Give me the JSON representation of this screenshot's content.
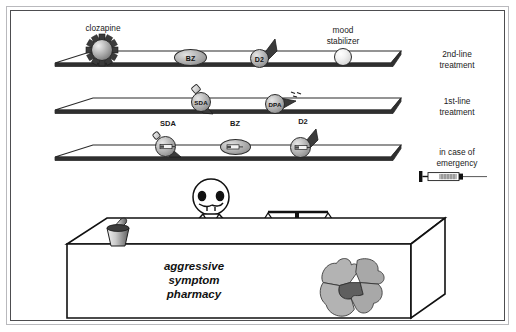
{
  "figure": {
    "title_text_block": [
      "aggressive",
      "symptom",
      "pharmacy"
    ],
    "shelves": [
      {
        "id": "second-line",
        "side_label": [
          "2nd-line",
          "treatment"
        ],
        "items": [
          {
            "key": "clozapine",
            "label": "clozapine",
            "inner_text": "",
            "icon": "spiky-sphere",
            "label_position": "above"
          },
          {
            "key": "bz",
            "label": "",
            "inner_text": "BZ",
            "icon": "oval",
            "label_position": "inside"
          },
          {
            "key": "d2",
            "label": "",
            "inner_text": "D2",
            "icon": "sphere-with-arrow",
            "label_position": "inside"
          },
          {
            "key": "mood-stabilizer",
            "label": "mood stabilizer",
            "inner_text": "",
            "icon": "light-sphere",
            "label_position": "above"
          }
        ]
      },
      {
        "id": "first-line",
        "side_label": [
          "1st-line",
          "treatment"
        ],
        "items": [
          {
            "key": "sda",
            "label": "",
            "inner_text": "SDA",
            "icon": "sphere-stub-cone",
            "label_position": "inside"
          },
          {
            "key": "dpa",
            "label": "",
            "inner_text": "DPA",
            "icon": "sphere-arrow-dashes",
            "label_position": "inside"
          }
        ]
      },
      {
        "id": "emergency",
        "side_label": [
          "in case of",
          "emergency"
        ],
        "items": [
          {
            "key": "sda-inj",
            "label": "SDA",
            "inner_text": "",
            "icon": "sphere-stub-cone-syringe",
            "label_position": "above"
          },
          {
            "key": "bz-inj",
            "label": "BZ",
            "inner_text": "",
            "icon": "oval-syringe",
            "label_position": "above"
          },
          {
            "key": "d2-inj",
            "label": "D2",
            "inner_text": "",
            "icon": "sphere-arrow-syringe",
            "label_position": "above"
          }
        ]
      }
    ],
    "counter": {
      "props": [
        "mortar-and-pestle",
        "balance-scale",
        "jigsaw-puzzle"
      ],
      "figure_character": "pharmacist"
    },
    "emergency_icon": "syringe"
  },
  "colors": {
    "frame": "#4d4d50",
    "outer_frame": "#b9b9bd",
    "ink": "#1a1a1a",
    "shelf_face": "#2f2f2f",
    "sphere_mid": "#a8a8a8",
    "puzzle_light": "#b0b0b0",
    "puzzle_dark": "#5f5f5f"
  }
}
